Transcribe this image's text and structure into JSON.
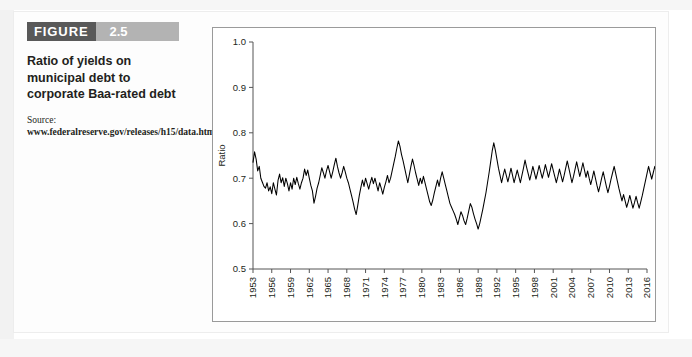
{
  "figure": {
    "tag_word": "FIGURE",
    "tag_number": "2.5",
    "caption": "Ratio of yields on municipal debt to corporate Baa-rated debt",
    "source_label": "Source: ",
    "source_url": "www.federalreserve.gov/releases/h15/data.htm."
  },
  "chart_data": {
    "type": "line",
    "title": "Ratio of yields on municipal debt to corporate Baa-rated debt",
    "xlabel": "",
    "ylabel": "Ratio",
    "xlim": [
      1953,
      2016
    ],
    "ylim": [
      0.5,
      1.0
    ],
    "ytick_labels": [
      "0.5",
      "0.6",
      "0.7",
      "0.8",
      "0.9",
      "1.0"
    ],
    "ytick_values": [
      0.5,
      0.6,
      0.7,
      0.8,
      0.9,
      1.0
    ],
    "xtick_labels": [
      "1953",
      "1956",
      "1959",
      "1962",
      "1965",
      "1968",
      "1971",
      "1974",
      "1977",
      "1980",
      "1983",
      "1986",
      "1989",
      "1992",
      "1995",
      "1998",
      "2001",
      "2004",
      "2007",
      "2010",
      "2013",
      "2016"
    ],
    "xtick_values": [
      1953,
      1956,
      1959,
      1962,
      1965,
      1968,
      1971,
      1974,
      1977,
      1980,
      1983,
      1986,
      1989,
      1992,
      1995,
      1998,
      2001,
      2004,
      2007,
      2010,
      2013,
      2016
    ],
    "grid": false,
    "legend": false,
    "line_color": "#000000",
    "series": [
      {
        "name": "Ratio of municipal to Baa corporate yields",
        "x_start": 1953.0,
        "x_step": 0.25,
        "values": [
          0.735,
          0.758,
          0.742,
          0.716,
          0.726,
          0.7,
          0.691,
          0.682,
          0.678,
          0.69,
          0.672,
          0.681,
          0.666,
          0.69,
          0.676,
          0.663,
          0.695,
          0.709,
          0.69,
          0.701,
          0.682,
          0.7,
          0.688,
          0.672,
          0.69,
          0.676,
          0.7,
          0.686,
          0.702,
          0.688,
          0.676,
          0.69,
          0.7,
          0.72,
          0.706,
          0.718,
          0.7,
          0.684,
          0.672,
          0.645,
          0.66,
          0.678,
          0.69,
          0.706,
          0.723,
          0.712,
          0.7,
          0.716,
          0.728,
          0.714,
          0.7,
          0.714,
          0.73,
          0.744,
          0.726,
          0.712,
          0.7,
          0.712,
          0.726,
          0.714,
          0.7,
          0.69,
          0.676,
          0.662,
          0.648,
          0.632,
          0.62,
          0.64,
          0.662,
          0.68,
          0.696,
          0.682,
          0.7,
          0.688,
          0.676,
          0.69,
          0.702,
          0.688,
          0.7,
          0.686,
          0.672,
          0.69,
          0.678,
          0.665,
          0.68,
          0.692,
          0.706,
          0.69,
          0.7,
          0.716,
          0.732,
          0.748,
          0.766,
          0.782,
          0.77,
          0.752,
          0.738,
          0.722,
          0.706,
          0.69,
          0.708,
          0.726,
          0.742,
          0.728,
          0.712,
          0.698,
          0.684,
          0.7,
          0.688,
          0.704,
          0.69,
          0.676,
          0.662,
          0.648,
          0.64,
          0.652,
          0.668,
          0.682,
          0.696,
          0.682,
          0.7,
          0.714,
          0.7,
          0.686,
          0.672,
          0.658,
          0.644,
          0.636,
          0.628,
          0.62,
          0.61,
          0.598,
          0.612,
          0.626,
          0.618,
          0.606,
          0.598,
          0.612,
          0.628,
          0.644,
          0.636,
          0.622,
          0.61,
          0.6,
          0.588,
          0.6,
          0.616,
          0.632,
          0.65,
          0.668,
          0.69,
          0.712,
          0.736,
          0.76,
          0.778,
          0.762,
          0.742,
          0.722,
          0.706,
          0.69,
          0.706,
          0.72,
          0.706,
          0.692,
          0.706,
          0.722,
          0.706,
          0.69,
          0.704,
          0.718,
          0.704,
          0.69,
          0.706,
          0.722,
          0.74,
          0.724,
          0.71,
          0.696,
          0.71,
          0.726,
          0.712,
          0.698,
          0.712,
          0.728,
          0.714,
          0.7,
          0.714,
          0.73,
          0.716,
          0.702,
          0.716,
          0.732,
          0.718,
          0.704,
          0.69,
          0.704,
          0.72,
          0.706,
          0.692,
          0.706,
          0.722,
          0.738,
          0.722,
          0.706,
          0.69,
          0.704,
          0.72,
          0.736,
          0.72,
          0.704,
          0.718,
          0.734,
          0.718,
          0.702,
          0.716,
          0.7,
          0.686,
          0.7,
          0.716,
          0.7,
          0.684,
          0.67,
          0.684,
          0.7,
          0.714,
          0.698,
          0.682,
          0.668,
          0.682,
          0.698,
          0.712,
          0.726,
          0.71,
          0.694,
          0.678,
          0.664,
          0.65,
          0.664,
          0.65,
          0.636,
          0.648,
          0.662,
          0.648,
          0.634,
          0.646,
          0.66,
          0.646,
          0.634,
          0.648,
          0.662,
          0.678,
          0.694,
          0.71,
          0.726,
          0.712,
          0.698,
          0.712,
          0.726,
          0.712,
          0.726,
          0.74,
          0.724,
          0.708,
          0.722,
          0.736,
          0.72,
          0.704,
          0.688,
          0.674,
          0.66,
          0.646,
          0.634,
          0.64,
          0.652,
          0.64,
          0.628,
          0.64,
          0.654,
          0.64,
          0.626,
          0.642,
          0.66,
          0.69,
          0.64,
          0.62,
          0.6,
          0.584,
          0.57,
          0.6,
          0.64,
          0.668,
          0.69,
          0.672,
          0.688,
          0.704,
          0.69,
          0.706,
          0.73,
          0.76,
          0.8,
          0.84,
          0.812,
          0.786,
          0.76,
          0.786,
          0.812,
          0.79,
          0.768,
          0.8,
          0.83,
          0.812,
          0.79,
          0.82,
          0.85,
          0.828,
          0.806,
          0.84,
          0.87,
          0.848,
          0.826,
          0.86,
          0.884,
          0.866,
          0.89,
          0.906,
          0.918,
          0.9,
          0.912
        ]
      }
    ]
  }
}
